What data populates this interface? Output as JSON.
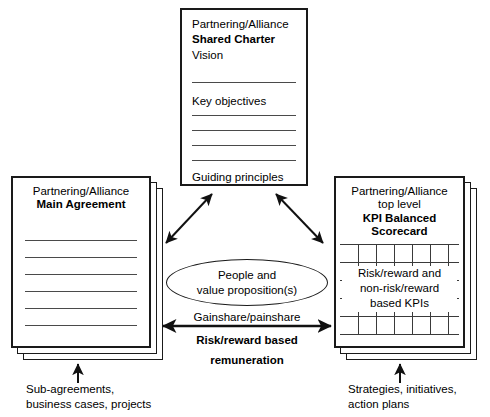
{
  "diagram": {
    "charter": {
      "org_line": "Partnering/Alliance",
      "title": "Shared Charter",
      "vision": "Vision",
      "key_objectives": "Key objectives",
      "guiding_principles": "Guiding principles",
      "rule_count_after_vision": 1,
      "rule_count_after_objectives": 4
    },
    "main_agreement": {
      "org_line": "Partnering/Alliance",
      "title": "Main Agreement",
      "rule_count": 6,
      "sheet_count": 2
    },
    "kpi_scorecard": {
      "org_line": "Partnering/Alliance",
      "sub_line": "top level",
      "title_line1": "KPI Balanced",
      "title_line2": "Scorecard",
      "body_line1": "Risk/reward and",
      "body_line2": "non-risk/reward",
      "body_line3": "based KPIs",
      "sheet_count": 2,
      "grid_rows": 6,
      "grid_cols": 6
    },
    "center_ellipse": {
      "line1": "People and",
      "line2": "value proposition(s)"
    },
    "remuneration": {
      "top_label": "Gainshare/painshare",
      "bold_line1": "Risk/reward based",
      "bold_line2": "remuneration"
    },
    "captions": {
      "left_line1": "Sub-agreements,",
      "left_line2": "business cases, projects",
      "right_line1": "Strategies, initiatives,",
      "right_line2": "action plans"
    },
    "colors": {
      "stroke": "#1a1a1a",
      "rule": "#4a4a4a",
      "grid": "#3a3a3a",
      "background": "#ffffff"
    }
  }
}
